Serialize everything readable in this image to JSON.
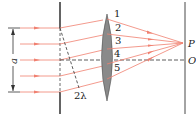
{
  "diagram": {
    "type": "single-slit diffraction (half-period zones)",
    "colors": {
      "ray": "#f08070",
      "line": "#333333",
      "lens": "#8a8a8a",
      "lens_edge": "#555555"
    },
    "labels": {
      "slit_width": "a",
      "path_difference": "2λ",
      "point_p": "P",
      "point_o": "O",
      "rays": [
        "1",
        "2",
        "3",
        "4",
        "5"
      ]
    }
  }
}
